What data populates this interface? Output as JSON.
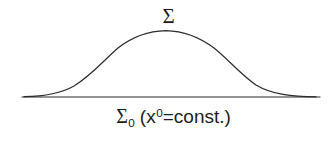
{
  "figure": {
    "background_color": "#ffffff",
    "stroke_color": "#2b2b2b",
    "text_color": "#1c1c1c",
    "width": 335,
    "height": 141,
    "curve_label": {
      "name": "sigma-curve-label",
      "text": "Σ"
    },
    "baseline_label": {
      "name": "sigma-zero-baseline-label",
      "full_text": "Σ₀ (x⁰=const.)",
      "sigma": "Σ",
      "sigma_subscript": "0",
      "open_paren": "(",
      "variable": "x",
      "variable_superscript": "0",
      "equals": "=",
      "value": "const.",
      "close_paren": ")"
    },
    "baseline": {
      "name": "sigma-zero-baseline",
      "x_start": 22,
      "x_end": 320,
      "y": 97,
      "stroke_width": 1.1
    },
    "curve": {
      "name": "sigma-hypersurface-curve",
      "stroke_width": 1.2,
      "peak_x": 165,
      "peak_y": 31,
      "left_foot_x": 28,
      "right_foot_x": 312,
      "path": "M 24 96.6 C 44 96.4 60 94 74 86 C 92 75 104 60 118 48 C 132 37 148 31 166 30.6 C 184 31 200 37.5 214 48 C 228 59 240 74 256 85 C 272 94.6 292 96.6 316 96.8"
    }
  }
}
